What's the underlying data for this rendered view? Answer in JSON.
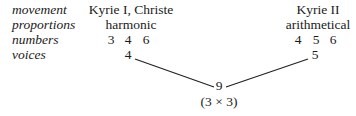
{
  "row_labels": {
    "movement": "movement",
    "proportions": "proportions",
    "numbers": "numbers",
    "voices": "voices"
  },
  "left": {
    "movement": "Kyrie I, Christe",
    "proportion": "harmonic",
    "numbers": [
      "3",
      "4",
      "6"
    ],
    "voices": "4"
  },
  "right": {
    "movement": "Kyrie II",
    "proportion": "arithmetical",
    "numbers": [
      "4",
      "5",
      "6"
    ],
    "voices": "5"
  },
  "result": {
    "value": "9",
    "note": "(3 × 3)"
  }
}
